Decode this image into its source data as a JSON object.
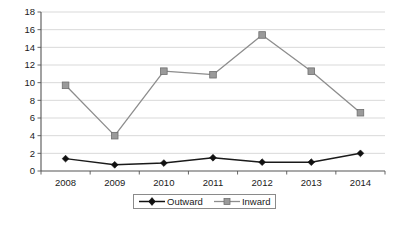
{
  "chart_data": {
    "type": "line",
    "title": "",
    "xlabel": "",
    "ylabel": "",
    "categories": [
      "2008",
      "2009",
      "2010",
      "2011",
      "2012",
      "2013",
      "2014"
    ],
    "series": [
      {
        "name": "Outward",
        "marker": "diamond",
        "color": "#111111",
        "values": [
          1.4,
          0.7,
          0.9,
          1.5,
          1.0,
          1.0,
          2.0
        ]
      },
      {
        "name": "Inward",
        "marker": "square",
        "color": "#9a9a9a",
        "values": [
          9.7,
          4.0,
          11.3,
          10.9,
          15.4,
          11.3,
          6.6
        ]
      }
    ],
    "ylim": [
      0,
      18
    ],
    "ytick_step": 2,
    "yticks": [
      "0",
      "2",
      "4",
      "6",
      "8",
      "10",
      "12",
      "14",
      "16",
      "18"
    ],
    "grid": true,
    "legend_position": "bottom-center"
  },
  "legend": {
    "entries": [
      {
        "label": "Outward",
        "marker": "diamond-marker-icon"
      },
      {
        "label": "Inward",
        "marker": "square-marker-icon"
      }
    ]
  },
  "caption": {
    "text": ""
  },
  "colors": {
    "outward": "#111111",
    "inward": "#9a9a9a",
    "grid": "#c9c9c9",
    "axis": "#555555",
    "background": "#ffffff"
  }
}
